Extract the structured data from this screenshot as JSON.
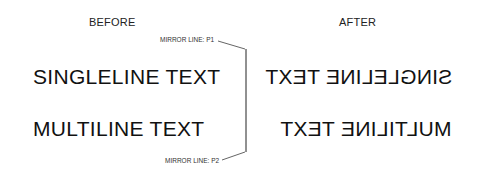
{
  "labels": {
    "before": "BEFORE",
    "after": "AFTER"
  },
  "before_text": {
    "singleline": "SINGLELINE TEXT",
    "multiline": "MULTILINE TEXT"
  },
  "after_text": {
    "singleline": "SINGLELINE TEXT",
    "multiline": "MULTILINE TEXT",
    "note": "rendered mirrored"
  },
  "mirror_line": {
    "p1_label": "MIRROR LINE: P1",
    "p2_label": "MIRROR LINE: P2",
    "color": "#222222"
  }
}
